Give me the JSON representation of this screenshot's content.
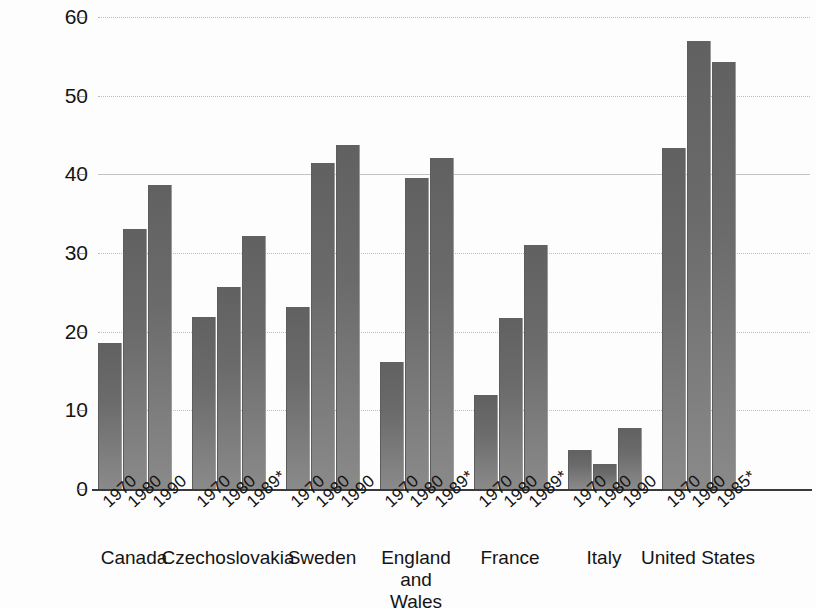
{
  "chart_data": {
    "type": "bar",
    "title": "",
    "subtitle": "",
    "xlabel": "",
    "ylabel": "Divorces per 100 marriages",
    "ylim": [
      0,
      60
    ],
    "yticks": [
      0,
      10,
      20,
      30,
      40,
      50,
      60
    ],
    "ytick_labels": [
      "0",
      "10",
      "20",
      "30",
      "40",
      "50",
      "60"
    ],
    "grid": true,
    "legend": "none",
    "bar_color": "#6e6e6e",
    "groups": [
      {
        "country": "Canada",
        "country_lines": [
          "Canada"
        ],
        "categories": [
          "1970",
          "1980",
          "1990"
        ],
        "values": [
          18.6,
          33.0,
          38.6
        ]
      },
      {
        "country": "Czechoslovakia",
        "country_lines": [
          "Czechoslovakia"
        ],
        "categories": [
          "1970",
          "1980",
          "1989*"
        ],
        "values": [
          21.9,
          25.7,
          32.2
        ]
      },
      {
        "country": "Sweden",
        "country_lines": [
          "Sweden"
        ],
        "categories": [
          "1970",
          "1980",
          "1990"
        ],
        "values": [
          23.1,
          41.5,
          43.7
        ]
      },
      {
        "country": "England and Wales",
        "country_lines": [
          "England",
          "and",
          "Wales"
        ],
        "categories": [
          "1970",
          "1980",
          "1989*"
        ],
        "values": [
          16.2,
          39.5,
          42.1
        ]
      },
      {
        "country": "France",
        "country_lines": [
          "France"
        ],
        "categories": [
          "1970",
          "1980",
          "1989*"
        ],
        "values": [
          11.9,
          21.8,
          31.0
        ]
      },
      {
        "country": "Italy",
        "country_lines": [
          "Italy"
        ],
        "categories": [
          "1970",
          "1980",
          "1990"
        ],
        "values": [
          4.9,
          3.2,
          7.8
        ]
      },
      {
        "country": "United States",
        "country_lines": [
          "United States"
        ],
        "categories": [
          "1970",
          "1980",
          "1985*"
        ],
        "values": [
          43.4,
          57.0,
          54.3
        ]
      }
    ],
    "all_categories": [
      "1970",
      "1980",
      "1990",
      "1970",
      "1980",
      "1989*",
      "1970",
      "1980",
      "1990",
      "1970",
      "1980",
      "1989*",
      "1970",
      "1980",
      "1989*",
      "1970",
      "1980",
      "1990",
      "1970",
      "1980",
      "1985*"
    ],
    "all_values": [
      18.6,
      33.0,
      38.6,
      21.9,
      25.7,
      32.2,
      23.1,
      41.5,
      43.7,
      16.2,
      39.5,
      42.1,
      11.9,
      21.8,
      31.0,
      4.9,
      3.2,
      7.8,
      43.4,
      57.0,
      54.3
    ]
  }
}
